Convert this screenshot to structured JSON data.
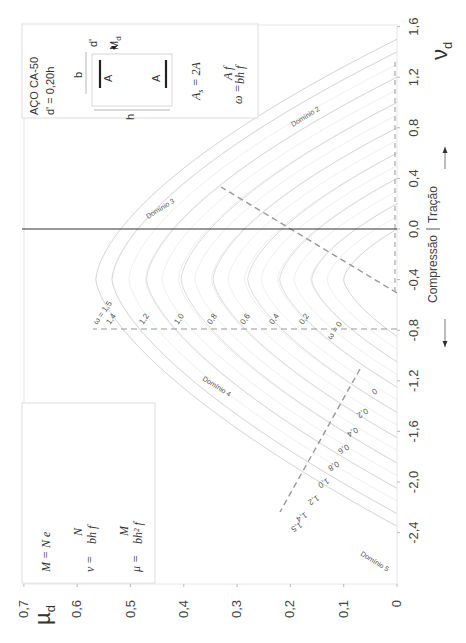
{
  "chart_data": {
    "type": "line",
    "orientation": "rotated 90° (µd on horizontal axis increasing leftward, νd on vertical axis)",
    "xlabel": "µd",
    "ylabel": "νd",
    "x_ticks": [
      "0,7",
      "0,6",
      "0,5",
      "0,4",
      "0,3",
      "0,2",
      "0,1",
      "0"
    ],
    "y_ticks": [
      "2,0",
      "1,6",
      "1,2",
      "0,8",
      "0,4",
      "0,0",
      "-0,4",
      "-0,8",
      "-1,2",
      "-1,6",
      "-2,0",
      "-2,4"
    ],
    "xlim": [
      0,
      0.7
    ],
    "ylim": [
      -2.4,
      2.0
    ],
    "grid": false,
    "series": [
      {
        "name": "ω = 0",
        "omega": 0.0,
        "mu_max": 0.1,
        "nu_at_max": -0.4,
        "nu_tension": 0.0,
        "nu_compression": -0.85
      },
      {
        "name": "ω = 0,2",
        "omega": 0.2,
        "mu_max": 0.16,
        "nu_at_max": -0.4,
        "nu_tension": 0.2,
        "nu_compression": -1.05
      },
      {
        "name": "ω = 0,4",
        "omega": 0.4,
        "mu_max": 0.22,
        "nu_at_max": -0.4,
        "nu_tension": 0.4,
        "nu_compression": -1.25
      },
      {
        "name": "ω = 0,6",
        "omega": 0.6,
        "mu_max": 0.28,
        "nu_at_max": -0.4,
        "nu_tension": 0.6,
        "nu_compression": -1.45
      },
      {
        "name": "ω = 0,8",
        "omega": 0.8,
        "mu_max": 0.345,
        "nu_at_max": -0.4,
        "nu_tension": 0.8,
        "nu_compression": -1.65
      },
      {
        "name": "ω = 1,0",
        "omega": 1.0,
        "mu_max": 0.405,
        "nu_at_max": -0.4,
        "nu_tension": 1.0,
        "nu_compression": -1.85
      },
      {
        "name": "ω = 1,2",
        "omega": 1.2,
        "mu_max": 0.47,
        "nu_at_max": -0.4,
        "nu_tension": 1.2,
        "nu_compression": -2.05
      },
      {
        "name": "ω = 1,4",
        "omega": 1.4,
        "mu_max": 0.535,
        "nu_at_max": -0.4,
        "nu_tension": 1.4,
        "nu_compression": -2.25
      },
      {
        "name": "ω = 1,5",
        "omega": 1.5,
        "mu_max": 0.565,
        "nu_at_max": -0.4,
        "nu_tension": 1.5,
        "nu_compression": -2.35
      }
    ],
    "annotations": [
      "Domínio 2",
      "Domínio 3",
      "Domínio 4",
      "Domínio 5",
      "Compressão",
      "Tração"
    ],
    "boundary_lines": [
      {
        "name": "domain 2/3 boundary",
        "style": "dashed",
        "from": [
          0.0,
          -0.12
        ],
        "to": [
          0.33,
          0.72
        ]
      },
      {
        "name": "domain 3/4 boundary",
        "style": "dashed",
        "from": [
          0.0,
          -0.4
        ],
        "to": [
          0.57,
          -0.4
        ]
      },
      {
        "name": "domain 4/5 boundary",
        "style": "dashed",
        "from": [
          0.07,
          -0.72
        ],
        "to": [
          0.22,
          -1.85
        ]
      },
      {
        "name": "tension limit",
        "style": "dashed",
        "from": [
          0.0,
          -0.1
        ],
        "to": [
          0.0,
          1.7
        ]
      }
    ]
  },
  "axes": {
    "mu_label": "µ",
    "mu_sub": "d",
    "nu_label": "ν",
    "nu_sub": "d",
    "mu_ticks": [
      "0,7",
      "0,6",
      "0,5",
      "0,4",
      "0,3",
      "0,2",
      "0,1",
      "0"
    ],
    "nu_ticks": [
      "2,0",
      "1,6",
      "1,2",
      "0,8",
      "0,4",
      "0,0",
      "-0,4",
      "-0,8",
      "-1,2",
      "-1,6",
      "-2,0",
      "-2,4"
    ]
  },
  "section_box": {
    "steel": "AÇO  CA-50",
    "cover": "d' = 0,20h",
    "b_label": "b",
    "h_label": "h",
    "dprime_label": "d'",
    "md_label": "M",
    "md_sub": "d",
    "bar_label": "A",
    "as_eq": "A",
    "as_sub": "s",
    "as_rhs": " = 2A",
    "omega_lhs": "ω =",
    "omega_num": "A f",
    "omega_den": "bh f"
  },
  "formula_box": {
    "line1": "M  = N  e",
    "line2_lhs": "ν  =",
    "line2_num": "N",
    "line2_den": "bh f",
    "line3_lhs": "μ  =",
    "line3_num": "M",
    "line3_den": "bh² f"
  },
  "domains": {
    "d2": "Domínio 2",
    "d3": "Domínio 3",
    "d4": "Domínio 4",
    "d5": "Domínio 5"
  },
  "omega_labels_top": [
    "ω = 1,5",
    "1,4",
    "1,2",
    "1,0",
    "0,8",
    "0,6",
    "0,4",
    "0,2",
    "ω = 0"
  ],
  "omega_labels_bottom": [
    "0",
    "0,2",
    "0,4",
    "0,6",
    "0,8",
    "1,0",
    "1,2",
    "1,4",
    "1,5"
  ],
  "side_labels": {
    "compression": "Compressão",
    "tension": "Tração"
  }
}
